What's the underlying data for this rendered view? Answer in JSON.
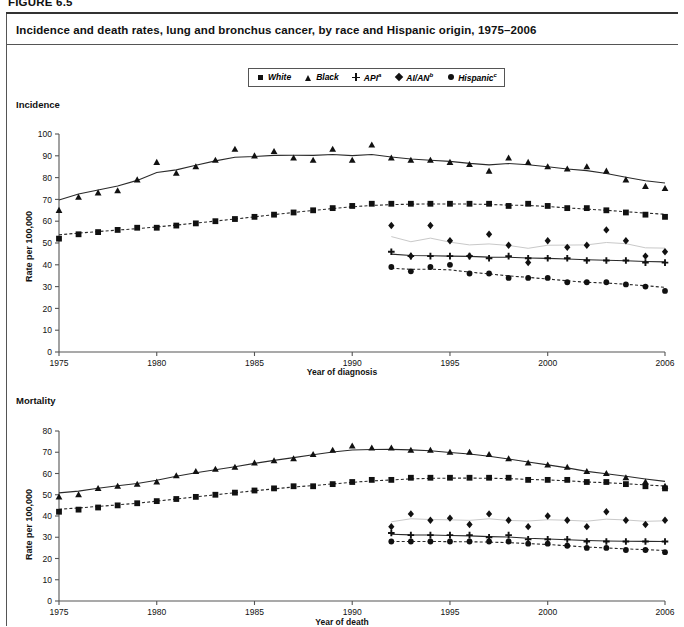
{
  "figure": {
    "number": "FIGURE 6.5",
    "title": "Incidence and death rates, lung and bronchus cancer, by race and Hispanic origin, 1975–2006"
  },
  "legend": {
    "items": [
      {
        "label": "White",
        "sup": "",
        "symbol": "square",
        "name": "legend-white"
      },
      {
        "label": "Black",
        "sup": "",
        "symbol": "triangle",
        "name": "legend-black"
      },
      {
        "label": "API",
        "sup": "a",
        "symbol": "plus",
        "name": "legend-api"
      },
      {
        "label": "AI/AN",
        "sup": "b",
        "symbol": "diamond",
        "name": "legend-aian"
      },
      {
        "label": "Hispanic",
        "sup": "c",
        "symbol": "circle",
        "name": "legend-hispanic"
      }
    ]
  },
  "panels": {
    "incidence": {
      "section_label": "Incidence",
      "ylabel": "Rate per 100,000",
      "xlabel": "Year of diagnosis"
    },
    "mortality": {
      "section_label": "Mortality",
      "ylabel": "Rate per 100,000",
      "xlabel": "Year of death"
    }
  },
  "chart_data": [
    {
      "id": "incidence",
      "type": "scatter",
      "title": "Incidence",
      "xlabel": "Year of diagnosis",
      "ylabel": "Rate per 100,000",
      "xlim": [
        1975,
        2006
      ],
      "ylim": [
        0,
        100
      ],
      "yticks": [
        0,
        10,
        20,
        30,
        40,
        50,
        60,
        70,
        80,
        90,
        100
      ],
      "xticks": [
        1975,
        1980,
        1985,
        1990,
        1995,
        2000,
        2006
      ],
      "grid": false,
      "legend_position": "top-center",
      "series": [
        {
          "name": "White",
          "symbol": "square",
          "line": "dashed",
          "x": [
            1975,
            1976,
            1977,
            1978,
            1979,
            1980,
            1981,
            1982,
            1983,
            1984,
            1985,
            1986,
            1987,
            1988,
            1989,
            1990,
            1991,
            1992,
            1993,
            1994,
            1995,
            1996,
            1997,
            1998,
            1999,
            2000,
            2001,
            2002,
            2003,
            2004,
            2005,
            2006
          ],
          "y": [
            52,
            54,
            55,
            56,
            57,
            57,
            58,
            59,
            60,
            61,
            62,
            63,
            64,
            65,
            66,
            67,
            68,
            68,
            68,
            68,
            68,
            68,
            68,
            67,
            68,
            67,
            66,
            66,
            65,
            64,
            63,
            62
          ]
        },
        {
          "name": "Black",
          "symbol": "triangle",
          "line": "solid",
          "x": [
            1975,
            1976,
            1977,
            1978,
            1979,
            1980,
            1981,
            1982,
            1983,
            1984,
            1985,
            1986,
            1987,
            1988,
            1989,
            1990,
            1991,
            1992,
            1993,
            1994,
            1995,
            1996,
            1997,
            1998,
            1999,
            2000,
            2001,
            2002,
            2003,
            2004,
            2005,
            2006
          ],
          "y": [
            65,
            71,
            73,
            74,
            79,
            87,
            82,
            85,
            88,
            93,
            90,
            92,
            89,
            88,
            93,
            88,
            95,
            89,
            88,
            88,
            87,
            86,
            83,
            89,
            87,
            85,
            84,
            85,
            83,
            79,
            76,
            75
          ]
        },
        {
          "name": "API",
          "symbol": "plus",
          "line": "solid",
          "x": [
            1992,
            1993,
            1994,
            1995,
            1996,
            1997,
            1998,
            1999,
            2000,
            2001,
            2002,
            2003,
            2004,
            2005,
            2006
          ],
          "y": [
            46,
            44,
            44,
            44,
            44,
            43,
            44,
            43,
            43,
            43,
            42,
            42,
            42,
            41,
            41
          ]
        },
        {
          "name": "AI/AN",
          "symbol": "diamond",
          "line": "solid-light",
          "x": [
            1992,
            1993,
            1994,
            1995,
            1996,
            1997,
            1998,
            1999,
            2000,
            2001,
            2002,
            2003,
            2004,
            2005,
            2006
          ],
          "y": [
            58,
            44,
            58,
            51,
            44,
            54,
            49,
            41,
            51,
            48,
            49,
            56,
            51,
            44,
            46
          ]
        },
        {
          "name": "Hispanic",
          "symbol": "circle",
          "line": "dashed",
          "x": [
            1992,
            1993,
            1994,
            1995,
            1996,
            1997,
            1998,
            1999,
            2000,
            2001,
            2002,
            2003,
            2004,
            2005,
            2006
          ],
          "y": [
            39,
            37,
            39,
            40,
            36,
            36,
            34,
            34,
            34,
            32,
            32,
            32,
            31,
            30,
            28
          ]
        }
      ]
    },
    {
      "id": "mortality",
      "type": "scatter",
      "title": "Mortality",
      "xlabel": "Year of death",
      "ylabel": "Rate per 100,000",
      "xlim": [
        1975,
        2006
      ],
      "ylim": [
        0,
        80
      ],
      "yticks": [
        0,
        10,
        20,
        30,
        40,
        50,
        60,
        70,
        80
      ],
      "xticks": [
        1975,
        1980,
        1985,
        1990,
        1995,
        2000,
        2006
      ],
      "grid": false,
      "legend_position": "top-center",
      "series": [
        {
          "name": "White",
          "symbol": "square",
          "line": "dashed",
          "x": [
            1975,
            1976,
            1977,
            1978,
            1979,
            1980,
            1981,
            1982,
            1983,
            1984,
            1985,
            1986,
            1987,
            1988,
            1989,
            1990,
            1991,
            1992,
            1993,
            1994,
            1995,
            1996,
            1997,
            1998,
            1999,
            2000,
            2001,
            2002,
            2003,
            2004,
            2005,
            2006
          ],
          "y": [
            42,
            43,
            44,
            45,
            46,
            47,
            48,
            49,
            50,
            51,
            52,
            53,
            54,
            54,
            55,
            56,
            57,
            57,
            58,
            58,
            58,
            58,
            58,
            58,
            57,
            57,
            57,
            56,
            56,
            55,
            54,
            53
          ]
        },
        {
          "name": "Black",
          "symbol": "triangle",
          "line": "solid",
          "x": [
            1975,
            1976,
            1977,
            1978,
            1979,
            1980,
            1981,
            1982,
            1983,
            1984,
            1985,
            1986,
            1987,
            1988,
            1989,
            1990,
            1991,
            1992,
            1993,
            1994,
            1995,
            1996,
            1997,
            1998,
            1999,
            2000,
            2001,
            2002,
            2003,
            2004,
            2005,
            2006
          ],
          "y": [
            49,
            50,
            53,
            54,
            55,
            56,
            59,
            61,
            62,
            63,
            65,
            66,
            67,
            69,
            71,
            73,
            72,
            72,
            71,
            71,
            70,
            70,
            69,
            67,
            65,
            64,
            63,
            61,
            60,
            58,
            56,
            54
          ]
        },
        {
          "name": "API",
          "symbol": "plus",
          "line": "solid",
          "x": [
            1992,
            1993,
            1994,
            1995,
            1996,
            1997,
            1998,
            1999,
            2000,
            2001,
            2002,
            2003,
            2004,
            2005,
            2006
          ],
          "y": [
            32,
            31,
            31,
            31,
            31,
            30,
            31,
            29,
            29,
            29,
            28,
            28,
            28,
            28,
            28
          ]
        },
        {
          "name": "AI/AN",
          "symbol": "diamond",
          "line": "solid-light",
          "x": [
            1992,
            1993,
            1994,
            1995,
            1996,
            1997,
            1998,
            1999,
            2000,
            2001,
            2002,
            2003,
            2004,
            2005,
            2006
          ],
          "y": [
            35,
            41,
            38,
            39,
            36,
            41,
            38,
            35,
            40,
            38,
            35,
            42,
            38,
            36,
            38
          ]
        },
        {
          "name": "Hispanic",
          "symbol": "circle",
          "line": "dashed",
          "x": [
            1992,
            1993,
            1994,
            1995,
            1996,
            1997,
            1998,
            1999,
            2000,
            2001,
            2002,
            2003,
            2004,
            2005,
            2006
          ],
          "y": [
            28,
            28,
            28,
            28,
            28,
            28,
            28,
            27,
            27,
            26,
            25,
            25,
            24,
            24,
            23
          ]
        }
      ]
    }
  ]
}
